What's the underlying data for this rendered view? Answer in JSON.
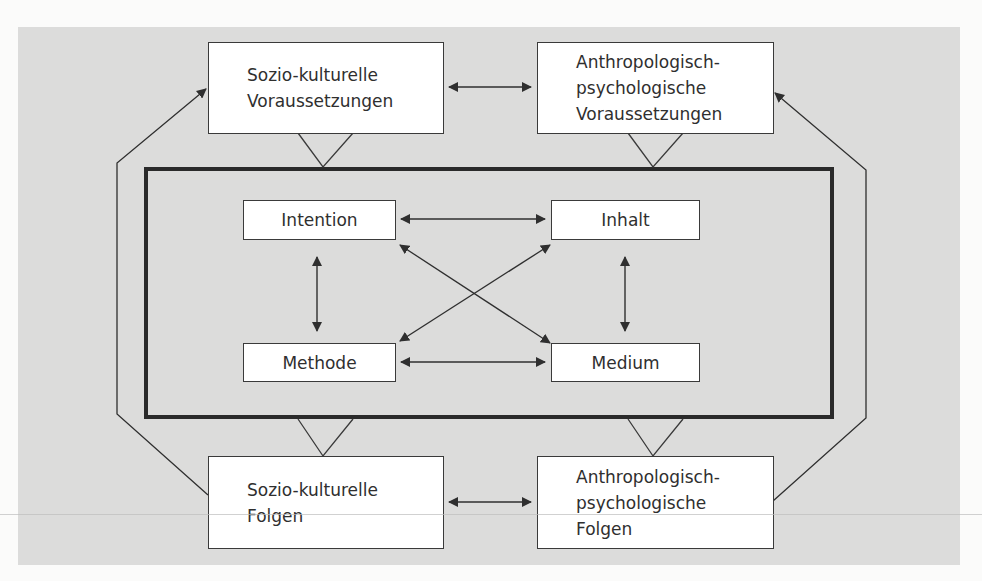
{
  "diagram": {
    "type": "flow-model",
    "colors": {
      "page_background": "#fbfbfa",
      "panel_background": "#dcdcdb",
      "box_fill": "#ffffff",
      "stroke": "#3a3a3a",
      "text": "#2f2f2f"
    },
    "outer_nodes": {
      "top_left": {
        "lines": [
          "Sozio-kulturelle",
          "Voraussetzungen"
        ]
      },
      "top_right": {
        "lines": [
          "Anthropologisch-",
          "psychologische",
          "Voraussetzungen"
        ]
      },
      "bottom_left": {
        "lines": [
          "Sozio-kulturelle",
          "Folgen"
        ]
      },
      "bottom_right": {
        "lines": [
          "Anthropologisch-",
          "psychologische",
          "Folgen"
        ]
      }
    },
    "inner_nodes": {
      "intention": "Intention",
      "inhalt": "Inhalt",
      "methode": "Methode",
      "medium": "Medium"
    },
    "edges": [
      {
        "from": "Sozio-kulturelle Voraussetzungen",
        "to": "Anthropologisch-psychologische Voraussetzungen",
        "direction": "both"
      },
      {
        "from": "Sozio-kulturelle Folgen",
        "to": "Anthropologisch-psychologische Folgen",
        "direction": "both"
      },
      {
        "from": "Intention",
        "to": "Inhalt",
        "direction": "both"
      },
      {
        "from": "Methode",
        "to": "Medium",
        "direction": "both"
      },
      {
        "from": "Intention",
        "to": "Methode",
        "direction": "both"
      },
      {
        "from": "Inhalt",
        "to": "Medium",
        "direction": "both"
      },
      {
        "from": "Intention",
        "to": "Medium",
        "direction": "both"
      },
      {
        "from": "Inhalt",
        "to": "Methode",
        "direction": "both"
      },
      {
        "from": "Sozio-kulturelle Voraussetzungen",
        "to": "inner frame",
        "direction": "funnel"
      },
      {
        "from": "Anthropologisch-psychologische Voraussetzungen",
        "to": "inner frame",
        "direction": "funnel"
      },
      {
        "from": "inner frame",
        "to": "Sozio-kulturelle Folgen",
        "direction": "funnel"
      },
      {
        "from": "inner frame",
        "to": "Anthropologisch-psychologische Folgen",
        "direction": "funnel"
      },
      {
        "from": "Sozio-kulturelle Folgen",
        "to": "Sozio-kulturelle Voraussetzungen",
        "direction": "forward",
        "route": "left loop"
      },
      {
        "from": "Anthropologisch-psychologische Folgen",
        "to": "Anthropologisch-psychologische Voraussetzungen",
        "direction": "forward",
        "route": "right loop"
      }
    ]
  }
}
